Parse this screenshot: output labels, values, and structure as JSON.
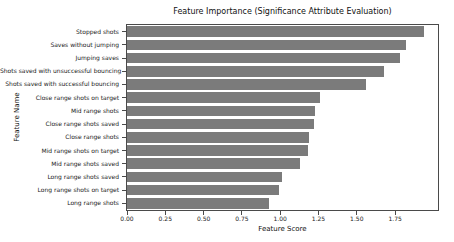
{
  "chart_data": {
    "type": "bar",
    "orientation": "horizontal",
    "title": "Feature Importance (Significance Attribute Evaluation)",
    "xlabel": "Feature Score",
    "ylabel": "Feature Name",
    "xlim": [
      0,
      2.03
    ],
    "xticks": [
      0,
      0.25,
      0.5,
      0.75,
      1.0,
      1.25,
      1.5,
      1.75
    ],
    "xtick_labels": [
      "0.00",
      "0.25",
      "0.50",
      "0.75",
      "1.00",
      "1.25",
      "1.50",
      "1.75"
    ],
    "categories": [
      "Stopped shots",
      "Saves without jumping",
      "Jumping saves",
      "Shots saved with unsuccessful bouncing",
      "Shots saved with successful bouncing",
      "Close range shots on target",
      "Mid range shots",
      "Close range shots saved",
      "Close range shots",
      "Mid range shots on target",
      "Mid range shots saved",
      "Long range shots saved",
      "Long range shots on target",
      "Long range shots"
    ],
    "values": [
      1.94,
      1.82,
      1.78,
      1.68,
      1.56,
      1.26,
      1.23,
      1.22,
      1.19,
      1.18,
      1.13,
      1.01,
      0.99,
      0.93
    ],
    "bar_color": "#7b7b7b",
    "axis_color": "#4a4a4a",
    "text_color": "#1a1a1a",
    "background": "#ffffff",
    "grid": false,
    "bar_fraction": 0.8
  }
}
